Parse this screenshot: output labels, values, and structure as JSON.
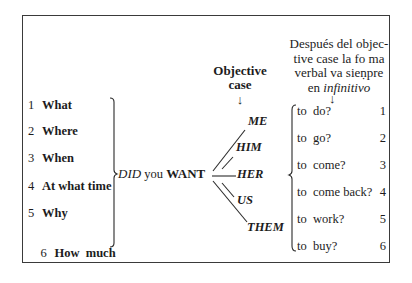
{
  "left_list": [
    {
      "num": "1",
      "label": "What"
    },
    {
      "num": "2",
      "label": "Where"
    },
    {
      "num": "3",
      "label": "When"
    },
    {
      "num": "4",
      "label": "At what time"
    },
    {
      "num": "5",
      "label": "Why"
    },
    {
      "num": "6",
      "label": "How  much"
    }
  ],
  "center": {
    "aux": "DID",
    "subject": "you",
    "verb": "WANT"
  },
  "objective_header": {
    "line1": "Objective",
    "line2": "case",
    "arrow": "↓"
  },
  "pronouns": [
    "ME",
    "HIM",
    "HER",
    "US",
    "THEM"
  ],
  "spanish_note": {
    "line1": "Después del objec-",
    "line2": "tive case la fo ma",
    "line3": "verbal va sieṇpre",
    "line4_prefix": "en",
    "line4_italic": "infinitivo",
    "arrow": "↓"
  },
  "right_list": [
    {
      "label": "to  do?",
      "num": "1"
    },
    {
      "label": "to  go?",
      "num": "2"
    },
    {
      "label": "to  come?",
      "num": "3"
    },
    {
      "label": "to  come back?",
      "num": "4"
    },
    {
      "label": "to  work?",
      "num": "5"
    },
    {
      "label": "to  buy?",
      "num": "6"
    }
  ]
}
